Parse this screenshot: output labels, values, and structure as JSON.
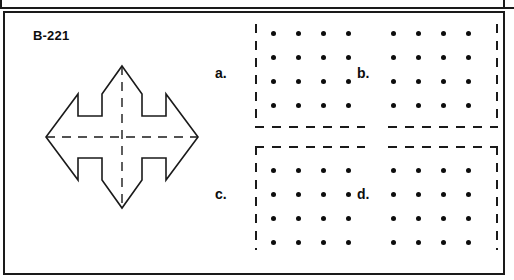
{
  "worksheet": {
    "problem_id": "B-221",
    "figure": {
      "name": "eight-pointed-star",
      "description": "Eight-pointed star outline with dashed vertical and horizontal symmetry axes",
      "stroke_color": "#1a1a1a",
      "fill_color": "#ffffff",
      "axis_style": "dashed"
    },
    "options": [
      {
        "key": "a",
        "label": "a.",
        "dot_rows": 4,
        "dot_cols": 4,
        "dashed_edges": "left-bottom"
      },
      {
        "key": "b",
        "label": "b.",
        "dot_rows": 4,
        "dot_cols": 4,
        "dashed_edges": "right-bottom"
      },
      {
        "key": "c",
        "label": "c.",
        "dot_rows": 4,
        "dot_cols": 4,
        "dashed_edges": "top-left"
      },
      {
        "key": "d",
        "label": "d.",
        "dot_rows": 4,
        "dot_cols": 4,
        "dashed_edges": "top-right"
      }
    ],
    "colors": {
      "ink": "#1a1a1a",
      "dot": "#0d0d0d",
      "paper": "#ffffff"
    }
  }
}
